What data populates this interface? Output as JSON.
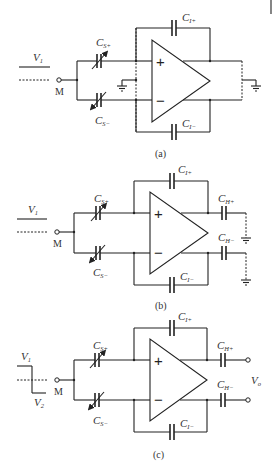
{
  "figure": {
    "panels": [
      {
        "id": "a",
        "caption": "(a)",
        "input_label": "V",
        "input_sub": "1",
        "node_label": "M",
        "cs_plus": {
          "main": "C",
          "sub": "S+"
        },
        "cs_minus": {
          "main": "C",
          "sub": "S−"
        },
        "ci_plus": {
          "main": "C",
          "sub": "I+"
        },
        "ci_minus": {
          "main": "C",
          "sub": "I−"
        },
        "opamp_plus": "+",
        "opamp_minus": "−"
      },
      {
        "id": "b",
        "caption": "(b)",
        "input_label": "V",
        "input_sub": "1",
        "node_label": "M",
        "cs_plus": {
          "main": "C",
          "sub": "S+"
        },
        "cs_minus": {
          "main": "C",
          "sub": "S−"
        },
        "ci_plus": {
          "main": "C",
          "sub": "I+"
        },
        "ci_minus": {
          "main": "C",
          "sub": "I−"
        },
        "ch_plus": {
          "main": "C",
          "sub": "H+"
        },
        "ch_minus": {
          "main": "C",
          "sub": "H−"
        },
        "opamp_plus": "+",
        "opamp_minus": "−"
      },
      {
        "id": "c",
        "caption": "(c)",
        "input_label": "V",
        "input_sub": "1",
        "input2_label": "V",
        "input2_sub": "2",
        "node_label": "M",
        "cs_plus": {
          "main": "C",
          "sub": "S+"
        },
        "cs_minus": {
          "main": "C",
          "sub": "S−"
        },
        "ci_plus": {
          "main": "C",
          "sub": "I+"
        },
        "ci_minus": {
          "main": "C",
          "sub": "I−"
        },
        "ch_plus": {
          "main": "C",
          "sub": "H+"
        },
        "ch_minus": {
          "main": "C",
          "sub": "H−"
        },
        "output_label": "V",
        "output_sub": "o",
        "opamp_plus": "+",
        "opamp_minus": "−"
      }
    ]
  }
}
